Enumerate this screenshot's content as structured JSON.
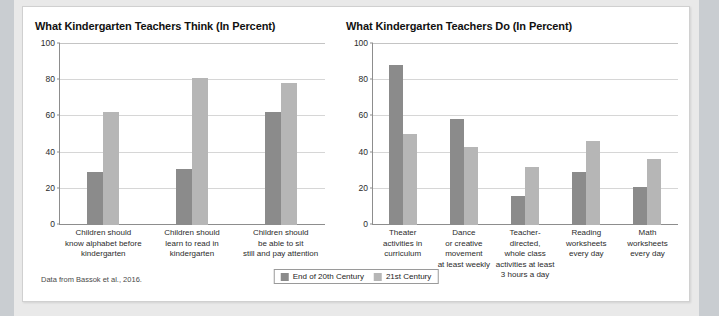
{
  "figure": {
    "source_note": "Data from Bassok et al., 2016.",
    "legend": {
      "position": "bottom-center",
      "entries": [
        {
          "label": "End of 20th Century",
          "color": "#8b8b8b"
        },
        {
          "label": "21st Century",
          "color": "#b6b6b6"
        }
      ]
    }
  },
  "chart_data": [
    {
      "type": "bar",
      "title": "What Kindergarten Teachers Think (In Percent)",
      "xlabel": "",
      "ylabel": "",
      "ylim": [
        0,
        100
      ],
      "yticks": [
        0,
        20,
        40,
        60,
        80,
        100
      ],
      "grid": true,
      "categories": [
        "Children should know alphabet before kindergarten",
        "Children should learn to read in kindergarten",
        "Children should be able to sit still and pay attention"
      ],
      "category_lines": [
        [
          "Children should",
          "know alphabet before",
          "kindergarten"
        ],
        [
          "Children should",
          "learn to read in",
          "kindergarten"
        ],
        [
          "Children should",
          "be able to sit",
          "still and pay attention"
        ]
      ],
      "series": [
        {
          "name": "End of 20th Century",
          "color": "#8b8b8b",
          "values": [
            29,
            31,
            62
          ]
        },
        {
          "name": "21st Century",
          "color": "#b6b6b6",
          "values": [
            62,
            81,
            78
          ]
        }
      ]
    },
    {
      "type": "bar",
      "title": "What Kindergarten Teachers Do (In Percent)",
      "xlabel": "",
      "ylabel": "",
      "ylim": [
        0,
        100
      ],
      "yticks": [
        0,
        20,
        40,
        60,
        80,
        100
      ],
      "grid": true,
      "categories": [
        "Theater activities in curriculum",
        "Dance or creative movement at least weekly",
        "Teacher-directed, whole class activities at least 3 hours a day",
        "Reading worksheets every day",
        "Math worksheets every day"
      ],
      "category_lines": [
        [
          "Theater",
          "activities in",
          "curriculum"
        ],
        [
          "Dance",
          "or creative",
          "movement",
          "at least weekly"
        ],
        [
          "Teacher-directed,",
          "whole class",
          "activities at least",
          "3 hours a day"
        ],
        [
          "Reading",
          "worksheets",
          "every day"
        ],
        [
          "Math",
          "worksheets",
          "every day"
        ]
      ],
      "series": [
        {
          "name": "End of 20th Century",
          "color": "#8b8b8b",
          "values": [
            88,
            58,
            16,
            29,
            21
          ]
        },
        {
          "name": "21st Century",
          "color": "#b6b6b6",
          "values": [
            50,
            43,
            32,
            46,
            36
          ]
        }
      ]
    }
  ]
}
